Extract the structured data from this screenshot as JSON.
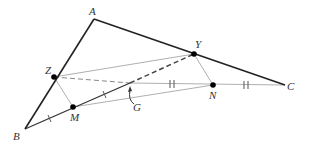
{
  "diagram": {
    "points": {
      "A": {
        "label": "A",
        "x": 94,
        "y": 19
      },
      "B": {
        "label": "B",
        "x": 25,
        "y": 129
      },
      "C": {
        "label": "C",
        "x": 285,
        "y": 85
      },
      "Y": {
        "label": "Y",
        "x": 194,
        "y": 54
      },
      "Z": {
        "label": "Z",
        "x": 54,
        "y": 77
      },
      "M": {
        "label": "M",
        "x": 73,
        "y": 107
      },
      "N": {
        "label": "N",
        "x": 213,
        "y": 85
      },
      "G": {
        "label": "G",
        "x": 130,
        "y": 83
      }
    },
    "labels": {
      "A": "A",
      "B": "B",
      "C": "C",
      "Y": "Y",
      "Z": "Z",
      "M": "M",
      "N": "N",
      "G": "G"
    },
    "colors": {
      "triangle": "#222222",
      "thin": "#aaaaaa",
      "dashed": "#555555",
      "dot": "#000000"
    }
  }
}
